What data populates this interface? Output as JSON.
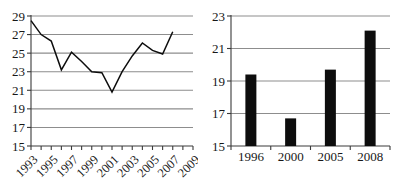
{
  "figure": {
    "panel_count": 2
  },
  "chart_data": [
    {
      "id": "left-line-chart",
      "type": "line",
      "title": "",
      "xlabel": "",
      "ylabel": "",
      "xlim": [
        1993,
        2009
      ],
      "ylim": [
        15,
        29
      ],
      "grid": true,
      "legend": "none",
      "y_ticks": [
        15,
        17,
        19,
        21,
        23,
        25,
        27,
        29
      ],
      "y_tick_labels": [
        "15",
        "17",
        "19",
        "21",
        "23",
        "25",
        "27",
        "29"
      ],
      "x_ticks": [
        1993,
        1994,
        1995,
        1996,
        1997,
        1998,
        1999,
        2000,
        2001,
        2002,
        2003,
        2004,
        2005,
        2006,
        2007,
        2008,
        2009
      ],
      "x_tick_labels": [
        "1993",
        "1995",
        "1997",
        "1999",
        "2001",
        "2003",
        "2005",
        "2007",
        "2009"
      ],
      "x_tick_label_years": [
        1993,
        1995,
        1997,
        1999,
        2001,
        2003,
        2005,
        2007,
        2009
      ],
      "x_tick_label_rotation": -45,
      "x": [
        1993,
        1994,
        1995,
        1996,
        1997,
        1998,
        1999,
        2000,
        2001,
        2002,
        2003,
        2004,
        2005,
        2006,
        2007
      ],
      "values": [
        28.5,
        27.0,
        26.3,
        23.2,
        25.1,
        24.1,
        23.0,
        22.9,
        20.8,
        23.0,
        24.7,
        26.1,
        25.3,
        24.9,
        27.3
      ],
      "line_color": "#0d0d0d",
      "grid_color": "#8d8d8d"
    },
    {
      "id": "right-bar-chart",
      "type": "bar",
      "title": "",
      "xlabel": "",
      "ylabel": "",
      "ylim": [
        15,
        23
      ],
      "grid": true,
      "legend": "none",
      "y_ticks": [
        15,
        17,
        19,
        21,
        23
      ],
      "y_tick_labels": [
        "15",
        "17",
        "19",
        "21",
        "23"
      ],
      "categories": [
        "1996",
        "2000",
        "2005",
        "2008"
      ],
      "values": [
        19.4,
        16.7,
        19.7,
        22.1
      ],
      "bar_color": "#0d0d0d",
      "grid_color": "#8d8d8d"
    }
  ]
}
